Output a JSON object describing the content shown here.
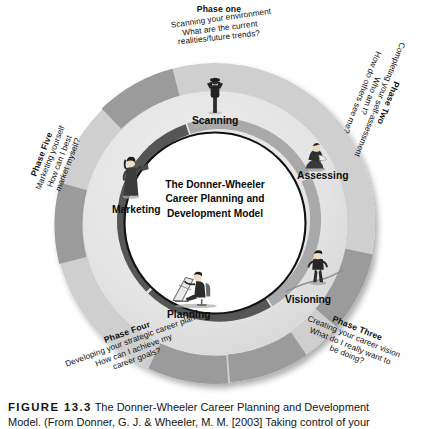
{
  "figure": {
    "number": "FIGURE 13.3",
    "caption_line1": "The Donner-Wheeler Career Planning and Development",
    "caption_line2": "Model. (From Donner, G. J. & Wheeler, M. M. [2003] Taking control of your"
  },
  "center": {
    "line1": "The Donner-Wheeler",
    "line2": "Career Planning and",
    "line3": "Development Model"
  },
  "phases": [
    {
      "id": "phase-one",
      "title": "Phase one",
      "line1": "Scanning your environment",
      "line2": "What are the current",
      "line3": "realities/future trends?"
    },
    {
      "id": "phase-two",
      "title": "Phase Two",
      "line1": "Completing your self-assessment",
      "line2": "Who am I?",
      "line3": "How do others see me?"
    },
    {
      "id": "phase-three",
      "title": "Phase Three",
      "line1": "Creating your career vision",
      "line2": "What do I really want to",
      "line3": "be doing?"
    },
    {
      "id": "phase-four",
      "title": "Phase Four",
      "line1": "Developing your strategic career plan",
      "line2": "How can I achieve my",
      "line3": "career goals?"
    },
    {
      "id": "phase-five",
      "title": "Phase Five",
      "line1": "Marketing yourself",
      "line2": "How can I best",
      "line3": "market myself?"
    }
  ],
  "stages": [
    {
      "id": "scanning",
      "label": "Scanning",
      "icon": "person-with-binoculars-icon"
    },
    {
      "id": "assessing",
      "label": "Assessing",
      "icon": "person-sitting-reading-icon"
    },
    {
      "id": "visioning",
      "label": "Visioning",
      "icon": "person-standing-on-path-icon"
    },
    {
      "id": "planning",
      "label": "Planning",
      "icon": "person-at-drafting-table-icon"
    },
    {
      "id": "marketing",
      "label": "Marketing",
      "icon": "person-with-megaphone-icon"
    }
  ],
  "colors": {
    "outer_ring_light": "#cfcfcf",
    "outer_ring_dark": "#9a9a9a",
    "mid_band": "#e4e4e4",
    "inner_ring_dark": "#585858",
    "inner_ring_light": "#ababab",
    "center_fill": "#ffffff",
    "outline": "#111111"
  }
}
